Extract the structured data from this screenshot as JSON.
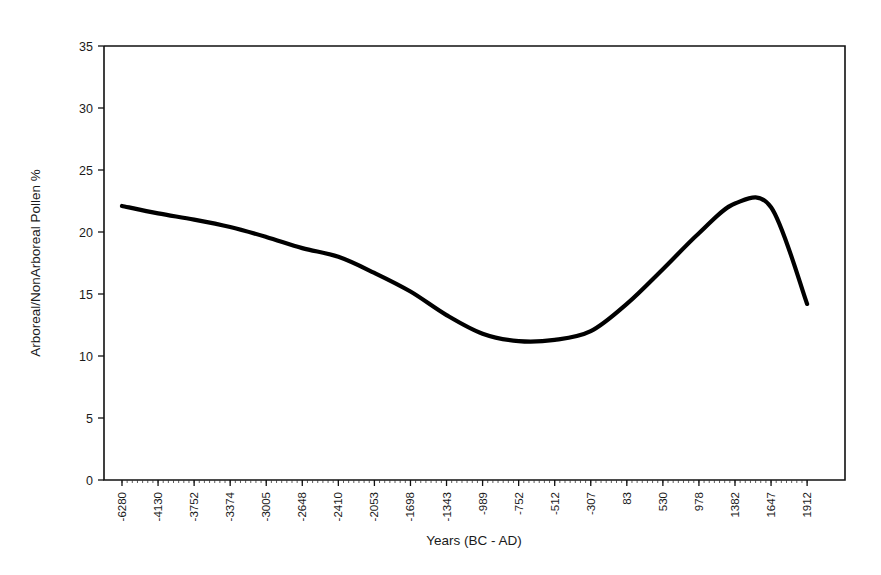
{
  "chart_data": {
    "type": "line",
    "title": "",
    "subtitle": "",
    "xlabel": "Years (BC - AD)",
    "ylabel": "Arboreal/NonArboreal Pollen %",
    "grid": false,
    "legend": null,
    "legend_position": "none",
    "ylim": [
      0,
      35
    ],
    "yticks": [
      0,
      5,
      10,
      15,
      20,
      25,
      30,
      35
    ],
    "ytick_labels": [
      "0",
      "5",
      "10",
      "15",
      "20",
      "25",
      "30",
      "35"
    ],
    "categories": [
      "-6280",
      "-4130",
      "-3752",
      "-3374",
      "-3005",
      "-2648",
      "-2410",
      "-2053",
      "-1698",
      "-1343",
      "-989",
      "-752",
      "-512",
      "-307",
      "83",
      "530",
      "978",
      "1382",
      "1647",
      "1912"
    ],
    "x": [
      -6280,
      -4130,
      -3752,
      -3374,
      -3005,
      -2648,
      -2410,
      -2053,
      -1698,
      -1343,
      -989,
      -752,
      -512,
      -307,
      83,
      530,
      978,
      1382,
      1647,
      1912
    ],
    "series": [
      {
        "name": "Arboreal/NonArboreal Pollen %",
        "color": "#000000",
        "values": [
          22.1,
          21.5,
          21.0,
          20.4,
          19.6,
          18.7,
          18.0,
          16.7,
          15.2,
          13.3,
          11.8,
          11.2,
          11.3,
          12.0,
          14.2,
          17.0,
          19.9,
          22.3,
          22.0,
          14.2
        ]
      }
    ],
    "annotations": []
  },
  "axes": {
    "y_axis_title": "Arboreal/NonArboreal Pollen %",
    "x_axis_title": "Years (BC - AD)"
  }
}
